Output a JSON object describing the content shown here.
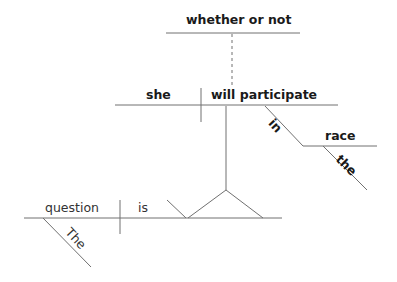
{
  "diagram": {
    "type": "Reed-Kellogg sentence diagram",
    "colors": {
      "line": "#707070",
      "text": "#1a1a1a",
      "background": "#ffffff"
    },
    "words": {
      "conjunction": "whether or not",
      "clause_subject": "she",
      "clause_verb": "will participate",
      "preposition": "in",
      "prep_object": "race",
      "prep_object_modifier": "the",
      "main_subject": "question",
      "main_subject_modifier": "The",
      "main_verb": "is"
    }
  }
}
